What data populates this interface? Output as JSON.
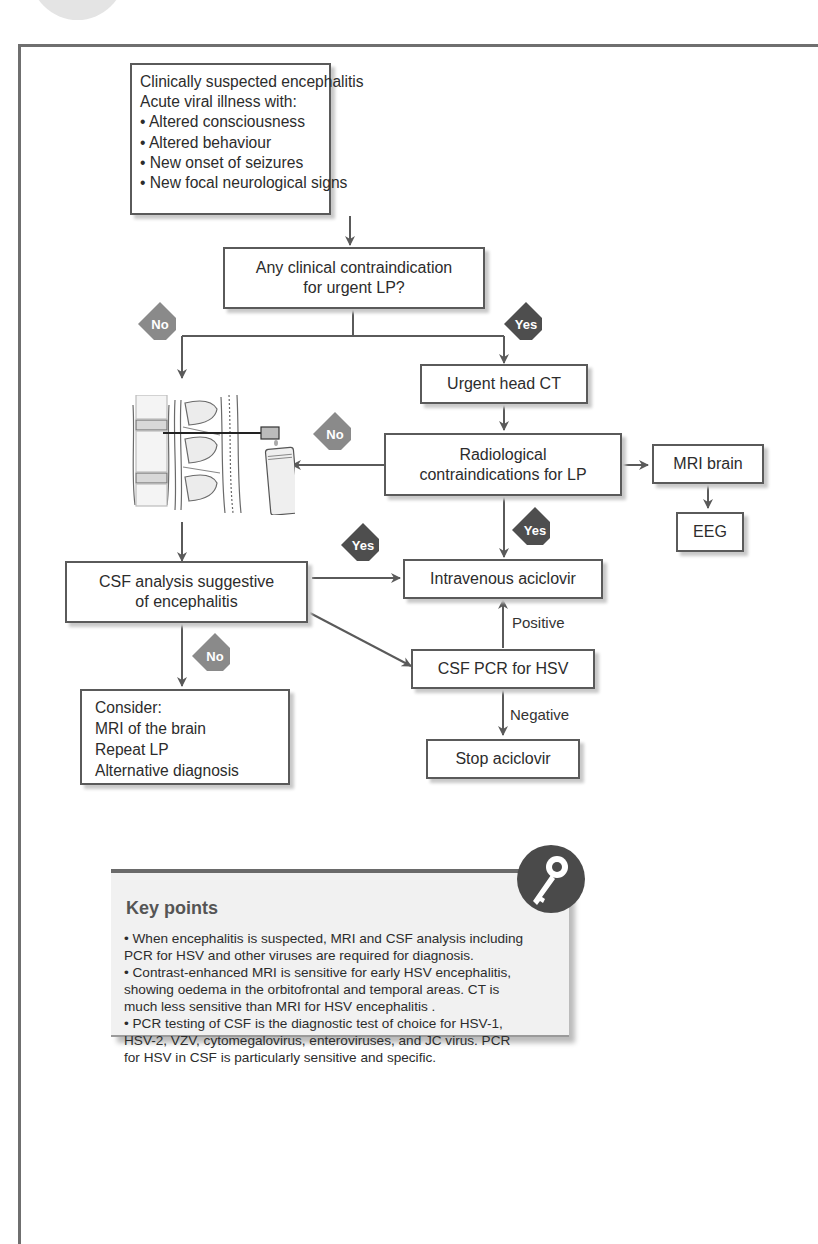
{
  "flowchart": {
    "nodes": {
      "start": {
        "lines": [
          "Clinically suspected encephalitis",
          "Acute viral illness with:",
          "• Altered consciousness",
          "• Altered behaviour",
          "• New onset of seizures",
          "• New focal neurological signs"
        ]
      },
      "contraindication": {
        "lines": [
          "Any clinical contraindication",
          "for urgent LP?"
        ]
      },
      "head_ct": {
        "lines": [
          "Urgent head CT"
        ]
      },
      "radiological": {
        "lines": [
          "Radiological",
          "contraindications for LP"
        ]
      },
      "mri": {
        "lines": [
          "MRI brain"
        ]
      },
      "eeg": {
        "lines": [
          "EEG"
        ]
      },
      "csf_analysis": {
        "lines": [
          "CSF analysis suggestive",
          "of encephalitis"
        ]
      },
      "aciclovir": {
        "lines": [
          "Intravenous aciclovir"
        ]
      },
      "pcr": {
        "lines": [
          "CSF PCR for HSV"
        ]
      },
      "stop": {
        "lines": [
          "Stop aciclovir"
        ]
      },
      "consider": {
        "lines": [
          "Consider:",
          "MRI of the brain",
          "Repeat LP",
          "Alternative diagnosis"
        ]
      }
    },
    "decisions": {
      "no_lp": "No",
      "yes_lp": "Yes",
      "no_radiological": "No",
      "yes_radiological": "Yes",
      "yes_csf": "Yes",
      "no_csf": "No"
    },
    "edge_labels": {
      "positive": "Positive",
      "negative": "Negative"
    },
    "colors": {
      "no_diamond": "#8a8a8a",
      "yes_diamond": "#4e4e4e",
      "line": "#5a5a5a"
    },
    "illustration": "lumbar-puncture-illustration"
  },
  "key_points": {
    "title": "Key points",
    "icon": "key-icon",
    "points": [
      [
        "• When encephalitis is suspected, MRI and CSF analysis including",
        "PCR for HSV and other viruses are required for diagnosis."
      ],
      [
        "• Contrast-enhanced MRI is sensitive for early HSV encephalitis,",
        "showing oedema in the orbitofrontal and temporal areas. CT is",
        "much less sensitive than MRI for HSV encephalitis ."
      ],
      [
        "• PCR testing of CSF is the diagnostic test of choice for HSV-1,",
        "HSV-2, VZV, cytomegalovirus, enteroviruses, and JC virus. PCR",
        "for HSV in CSF is particularly sensitive and specific."
      ]
    ]
  }
}
